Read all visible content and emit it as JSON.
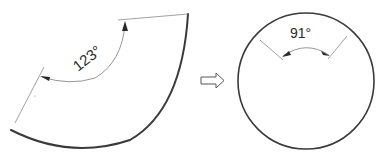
{
  "diagram": {
    "type": "sector-to-cone-geometry",
    "left_figure": {
      "name": "sector (unrolled cone surface)",
      "angle_label": "123°",
      "angle_value": 123
    },
    "transition": {
      "icon": "right-arrow-outline"
    },
    "right_figure": {
      "name": "circle (cone viewed from top)",
      "angle_label": "91°",
      "angle_value": 91
    },
    "colors": {
      "outline": "#3a3a3a",
      "construction_lines": "#8a8a8a",
      "background": "#ffffff"
    }
  }
}
